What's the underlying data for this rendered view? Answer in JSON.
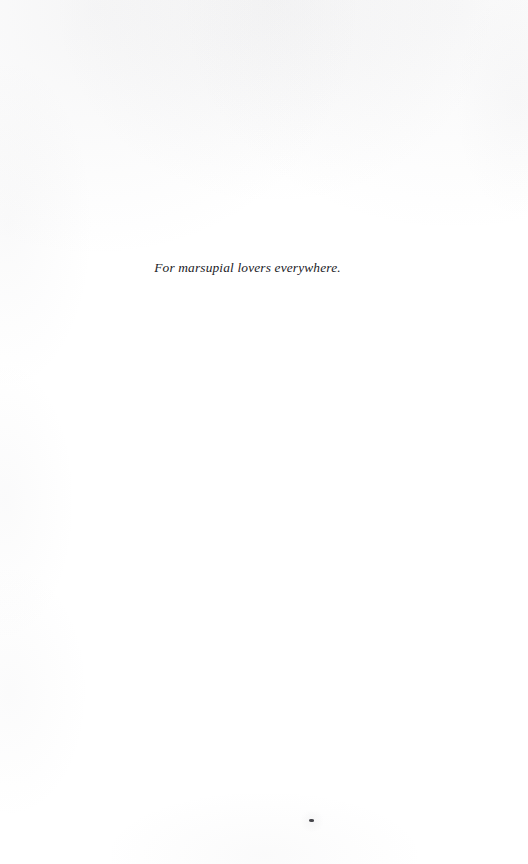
{
  "page": {
    "kind": "book-dedication-page",
    "background_color": "#ffffff",
    "width": 528,
    "height": 864
  },
  "dedication": {
    "text": "For marsupial lovers everywhere.",
    "text_color": "#1b1b1f",
    "style": "italic-serif"
  },
  "artifacts": {
    "speck_label": "",
    "top_edge_label": ""
  }
}
